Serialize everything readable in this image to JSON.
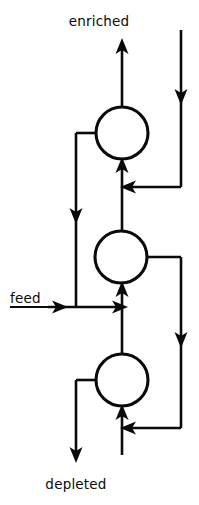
{
  "diagram": {
    "type": "process-flow-cascade",
    "title_visible": false,
    "background_color": "#ffffff",
    "line_color": "#0a0a0a",
    "labels": {
      "enriched": "enriched",
      "feed": "feed",
      "depleted": "depleted"
    },
    "stages": [
      {
        "id": "stage-top",
        "name": "top-stage",
        "cx": 122,
        "cy": 133,
        "r": 26
      },
      {
        "id": "stage-middle",
        "name": "middle-stage",
        "cx": 121,
        "cy": 257,
        "r": 26
      },
      {
        "id": "stage-bottom",
        "name": "bottom-stage",
        "cx": 122,
        "cy": 380,
        "r": 26
      }
    ],
    "streams": [
      {
        "name": "enriched-product-out",
        "from": "stage-top",
        "to": "enriched-label",
        "direction": "up"
      },
      {
        "name": "top-stage-tails-down",
        "from": "stage-top",
        "to": "middle-stage-feed",
        "direction": "down"
      },
      {
        "name": "middle-stage-product-up",
        "from": "stage-middle",
        "to": "stage-top",
        "direction": "up"
      },
      {
        "name": "external-enriched-recycle-in",
        "from": "top-right-inlet",
        "to": "stage-top",
        "direction": "down"
      },
      {
        "name": "feed-inlet",
        "from": "feed-label",
        "to": "stage-middle",
        "direction": "right"
      },
      {
        "name": "middle-stage-tails-recycle",
        "from": "stage-middle",
        "to": "stage-bottom",
        "direction": "down"
      },
      {
        "name": "bottom-stage-product-up",
        "from": "stage-bottom",
        "to": "stage-middle",
        "direction": "up"
      },
      {
        "name": "depleted-product-out",
        "from": "stage-bottom",
        "to": "depleted-label",
        "direction": "down"
      }
    ]
  }
}
